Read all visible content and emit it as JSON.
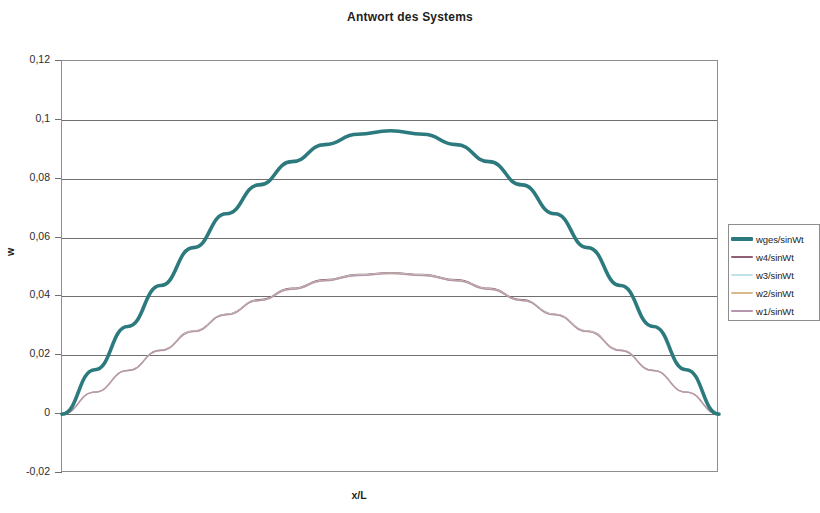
{
  "chart_data": {
    "type": "line",
    "title": "Antwort des Systems",
    "xlabel": "x/L",
    "ylabel": "w",
    "grid": true,
    "legend_position": "right",
    "ylim": [
      -0.02,
      0.12
    ],
    "yticks": [
      "0,12",
      "0,1",
      "0,08",
      "0,06",
      "0,04",
      "0,02",
      "0",
      "-0,02"
    ],
    "ytick_values": [
      0.12,
      0.1,
      0.08,
      0.06,
      0.04,
      0.02,
      0,
      -0.02
    ],
    "xlim": [
      0,
      1
    ],
    "xticks": [],
    "x": [
      0,
      0.05,
      0.1,
      0.15,
      0.2,
      0.25,
      0.3,
      0.35,
      0.4,
      0.45,
      0.5,
      0.55,
      0.6,
      0.65,
      0.7,
      0.75,
      0.8,
      0.85,
      0.9,
      0.95,
      1
    ],
    "series": [
      {
        "name": "wges/sinWt",
        "color": "#2d7a7e",
        "width": 3.6,
        "peak": 0.0963,
        "values": [
          0,
          0.0151,
          0.0298,
          0.0437,
          0.0566,
          0.0681,
          0.0779,
          0.0858,
          0.0916,
          0.0951,
          0.0963,
          0.0951,
          0.0916,
          0.0858,
          0.0779,
          0.0681,
          0.0566,
          0.0437,
          0.0298,
          0.0151,
          0
        ]
      },
      {
        "name": "w4/sinWt",
        "color": "#8f5f74",
        "width": 1.2,
        "peak": 0.0481,
        "values": [
          0,
          0.0075,
          0.0149,
          0.0218,
          0.0283,
          0.034,
          0.0389,
          0.0428,
          0.0457,
          0.0475,
          0.0481,
          0.0475,
          0.0457,
          0.0428,
          0.0389,
          0.034,
          0.0283,
          0.0218,
          0.0149,
          0.0075,
          0
        ]
      },
      {
        "name": "w3/sinWt",
        "color": "#bfe3e8",
        "width": 1.2,
        "peak": 0.0479,
        "values": [
          0,
          0.0075,
          0.0148,
          0.0217,
          0.0282,
          0.0339,
          0.0387,
          0.0426,
          0.0455,
          0.0473,
          0.0479,
          0.0473,
          0.0455,
          0.0426,
          0.0387,
          0.0339,
          0.0282,
          0.0217,
          0.0148,
          0.0075,
          0
        ]
      },
      {
        "name": "w2/sinWt",
        "color": "#d8b98b",
        "width": 1.2,
        "peak": 0.0478,
        "values": [
          0,
          0.0075,
          0.0148,
          0.0217,
          0.0281,
          0.0338,
          0.0386,
          0.0425,
          0.0454,
          0.0472,
          0.0478,
          0.0472,
          0.0454,
          0.0425,
          0.0386,
          0.0338,
          0.0281,
          0.0217,
          0.0148,
          0.0075,
          0
        ]
      },
      {
        "name": "w1/sinWt",
        "color": "#b596ae",
        "width": 1.2,
        "peak": 0.0477,
        "values": [
          0,
          0.0075,
          0.0148,
          0.0216,
          0.028,
          0.0337,
          0.0386,
          0.0424,
          0.0453,
          0.0471,
          0.0477,
          0.0471,
          0.0453,
          0.0424,
          0.0386,
          0.0337,
          0.028,
          0.0216,
          0.0148,
          0.0075,
          0
        ]
      }
    ]
  }
}
